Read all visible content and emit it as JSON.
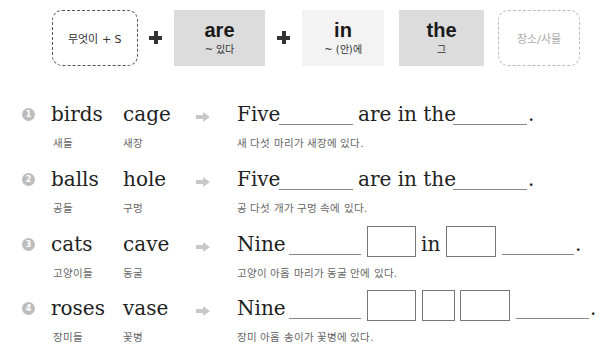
{
  "formula": {
    "boxes": [
      {
        "id": "subject",
        "text": "무엇이 + S",
        "style": "dashed"
      },
      {
        "id": "are",
        "word": "are",
        "meaning": "~ 있다",
        "style": "gray"
      },
      {
        "id": "in",
        "word": "in",
        "meaning": "~ (안)에",
        "style": "lightgray"
      },
      {
        "id": "the",
        "word": "the",
        "meaning": "그",
        "style": "gray"
      },
      {
        "id": "place",
        "text": "장소/사물",
        "style": "dashed-light"
      }
    ],
    "plus_symbols": [
      "+",
      "+"
    ]
  },
  "exercises": [
    {
      "number": "1",
      "word1": "birds",
      "word1_ko": "새들",
      "word2": "cage",
      "word2_ko": "새장",
      "sentence_start": "Five",
      "sentence_mid": "are in the",
      "period": ".",
      "translation": "새 다섯 마리가 새장에 있다."
    },
    {
      "number": "2",
      "word1": "balls",
      "word1_ko": "공들",
      "word2": "hole",
      "word2_ko": "구멍",
      "sentence_start": "Five",
      "sentence_mid": "are in the",
      "period": ".",
      "translation": "공 다섯 개가 구멍 속에 있다."
    },
    {
      "number": "3",
      "word1": "cats",
      "word1_ko": "고양이들",
      "word2": "cave",
      "word2_ko": "동굴",
      "sentence_start": "Nine",
      "sentence_mid": "in",
      "period": ".",
      "translation": "고양이 아홉 마리가 동굴 안에 있다."
    },
    {
      "number": "4",
      "word1": "roses",
      "word1_ko": "장미들",
      "word2": "vase",
      "word2_ko": "꽃병",
      "sentence_start": "Nine",
      "period": ".",
      "translation": "장미 아홉 송이가 꽃병에 있다."
    }
  ]
}
